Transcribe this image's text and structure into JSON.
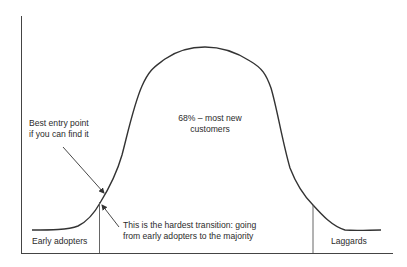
{
  "diagram": {
    "type": "technology adoption bell curve",
    "colors": {
      "line": "#333333",
      "text": "#2b2b2b",
      "background": "#ffffff"
    },
    "segments": [
      {
        "name": "Early adopters",
        "label": "Early adopters"
      },
      {
        "name": "Majority",
        "label": "68% – most new customers"
      },
      {
        "name": "Laggards",
        "label": "Laggards"
      }
    ],
    "annotations": {
      "peak_line1": "68% – most new",
      "peak_line2": "customers",
      "entry_line1": "Best entry point",
      "entry_line2": "if you can find it",
      "hardest_line1": "This is the hardest transition: going",
      "hardest_line2": "from early adopters to the majority"
    },
    "labels": {
      "early_adopters": "Early adopters",
      "laggards": "Laggards"
    }
  }
}
